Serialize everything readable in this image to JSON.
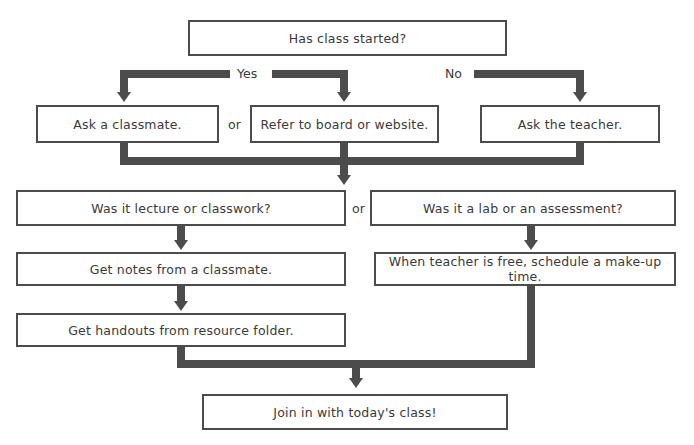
{
  "diagram": {
    "title_node": {
      "text": "Has class started?"
    },
    "branch_labels": {
      "yes": "Yes",
      "no": "No"
    },
    "or_labels": {
      "row1": "or",
      "row2": "or"
    },
    "nodes": [
      {
        "id": "start",
        "text": "Has class started?"
      },
      {
        "id": "classmate",
        "text": "Ask a classmate."
      },
      {
        "id": "board",
        "text": "Refer to board or website."
      },
      {
        "id": "teacher",
        "text": "Ask the teacher."
      },
      {
        "id": "lecture_q",
        "text": "Was it lecture or classwork?"
      },
      {
        "id": "lab_q",
        "text": "Was it a lab or an assessment?"
      },
      {
        "id": "notes",
        "text": "Get notes from a classmate."
      },
      {
        "id": "makeup",
        "text": "When teacher is free, schedule a make-up time."
      },
      {
        "id": "handouts",
        "text": "Get handouts from resource folder."
      },
      {
        "id": "join",
        "text": "Join in with today's class!"
      }
    ],
    "colors": {
      "connector": "#4c4c4c",
      "box_border": "#4c4c4c",
      "text": "#3a3a3a",
      "background": "#ffffff"
    }
  }
}
